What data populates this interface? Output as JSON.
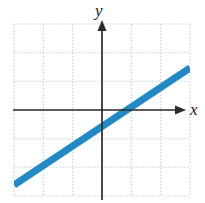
{
  "figure": {
    "name": "linear-function-graph",
    "background_color": "#ffffff"
  },
  "axes": {
    "x_label": "x",
    "y_label": "y",
    "color": "#2b2b2b",
    "origin_px": {
      "x": 102,
      "y": 110
    },
    "x_start_px": 13,
    "x_end_px": 186,
    "y_start_px": 200,
    "y_end_px": 20,
    "arrowheads": true
  },
  "grid": {
    "color": "#c9c9d6",
    "style": "dotted",
    "left_px": 14,
    "top_px": 24,
    "right_px": 190,
    "bottom_px": 196,
    "cell_width_px": 29.33,
    "cell_height_px": 28.67,
    "columns": 6,
    "rows": 6,
    "x_lines_px": [
      14,
      43.3,
      72.7,
      102,
      131.3,
      160.7,
      190
    ],
    "y_lines_px": [
      24,
      52.7,
      81.3,
      110,
      138.7,
      167.3,
      196
    ]
  },
  "chart_data": {
    "type": "line",
    "title": "",
    "xlabel": "x",
    "ylabel": "y",
    "grid": true,
    "legend": false,
    "xlim": [
      -3,
      3
    ],
    "ylim": [
      -3,
      3
    ],
    "series": [
      {
        "name": "line",
        "color": "#2389c4",
        "line_width_px": 7,
        "x": [
          -3,
          3
        ],
        "y": [
          -2.6,
          1.5
        ],
        "slope": 0.68,
        "intercept": -0.55,
        "pixel_start": {
          "x": 14,
          "y": 185
        },
        "pixel_end": {
          "x": 190,
          "y": 68
        }
      }
    ]
  }
}
